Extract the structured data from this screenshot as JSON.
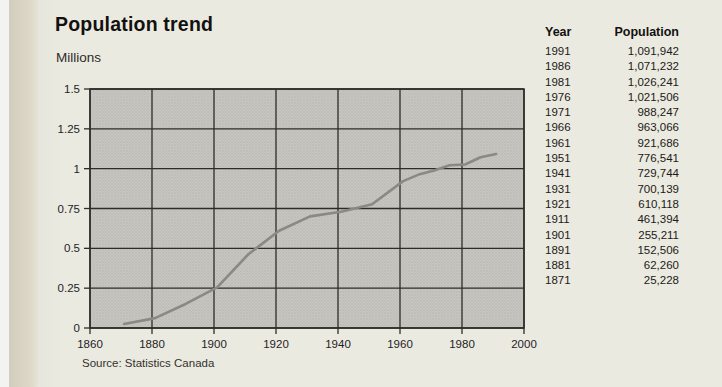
{
  "page": {
    "title": "Population trend",
    "source": "Source: Statistics Canada"
  },
  "table": {
    "headers": [
      "Year",
      "Population"
    ],
    "rows": [
      [
        "1991",
        "1,091,942"
      ],
      [
        "1986",
        "1,071,232"
      ],
      [
        "1981",
        "1,026,241"
      ],
      [
        "1976",
        "1,021,506"
      ],
      [
        "1971",
        "988,247"
      ],
      [
        "1966",
        "963,066"
      ],
      [
        "1961",
        "921,686"
      ],
      [
        "1951",
        "776,541"
      ],
      [
        "1941",
        "729,744"
      ],
      [
        "1931",
        "700,139"
      ],
      [
        "1921",
        "610,118"
      ],
      [
        "1911",
        "461,394"
      ],
      [
        "1901",
        "255,211"
      ],
      [
        "1891",
        "152,506"
      ],
      [
        "1881",
        "62,260"
      ],
      [
        "1871",
        "25,228"
      ]
    ]
  },
  "chart_data": {
    "type": "line",
    "title": "Population trend",
    "ylabel": "Millions",
    "xlabel": "",
    "source": "Source: Statistics Canada",
    "x": [
      1871,
      1881,
      1891,
      1901,
      1911,
      1921,
      1931,
      1941,
      1951,
      1961,
      1966,
      1971,
      1976,
      1981,
      1986,
      1991
    ],
    "values": [
      0.025228,
      0.06226,
      0.152506,
      0.255211,
      0.461394,
      0.610118,
      0.700139,
      0.729744,
      0.776541,
      0.921686,
      0.963066,
      0.988247,
      1.021506,
      1.026241,
      1.071232,
      1.091942
    ],
    "xlim": [
      1860,
      2000
    ],
    "ylim": [
      0,
      1.5
    ],
    "x_ticks": [
      {
        "v": 1860,
        "label": "1860"
      },
      {
        "v": 1880,
        "label": "1880"
      },
      {
        "v": 1900,
        "label": "1900"
      },
      {
        "v": 1920,
        "label": "1920"
      },
      {
        "v": 1940,
        "label": "1940"
      },
      {
        "v": 1960,
        "label": "1960"
      },
      {
        "v": 1980,
        "label": "1980"
      },
      {
        "v": 2000,
        "label": "2000"
      }
    ],
    "y_ticks": [
      {
        "v": 0,
        "label": "0"
      },
      {
        "v": 0.25,
        "label": "0.25"
      },
      {
        "v": 0.5,
        "label": "0.5"
      },
      {
        "v": 0.75,
        "label": "0.75"
      },
      {
        "v": 1,
        "label": "1"
      },
      {
        "v": 1.25,
        "label": "1.25"
      },
      {
        "v": 1.5,
        "label": "1.5"
      }
    ],
    "grid": true,
    "legend": "none"
  },
  "colors": {
    "page_background": "#ebeae1",
    "gutter": "#d8d4c3",
    "plot_background": "#c7c6c1",
    "plot_dot": "#b6b5af",
    "grid": "#2e2c29",
    "line": "#8a8983",
    "text": "#1c1a17"
  }
}
